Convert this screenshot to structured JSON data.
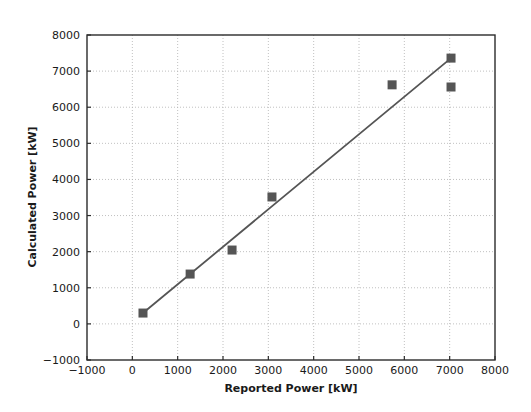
{
  "chart_data": {
    "type": "scatter",
    "title": "",
    "xlabel": "Reported Power [kW]",
    "ylabel": "Calculated Power [kW]",
    "xlim": [
      -1000,
      8000
    ],
    "ylim": [
      -1000,
      8000
    ],
    "xticks": [
      -1000,
      0,
      1000,
      2000,
      3000,
      4000,
      5000,
      6000,
      7000,
      8000
    ],
    "yticks": [
      -1000,
      0,
      1000,
      2000,
      3000,
      4000,
      5000,
      6000,
      7000,
      8000
    ],
    "xtick_labels": [
      "-1000",
      "0",
      "1000",
      "2000",
      "3000",
      "4000",
      "5000",
      "6000",
      "7000",
      "8000"
    ],
    "ytick_labels": [
      "-1000",
      "0",
      "1000",
      "2000",
      "3000",
      "4000",
      "5000",
      "6000",
      "7000",
      "8000"
    ],
    "grid": true,
    "grid_style": "dotted",
    "legend": null,
    "marker_color": "#555555",
    "line_color": "#555555",
    "marker_style": "square",
    "series": [
      {
        "name": "Reported vs Calculated Power",
        "type": "scatter",
        "points": [
          {
            "x": 235,
            "y": 300
          },
          {
            "x": 1275,
            "y": 1380
          },
          {
            "x": 2200,
            "y": 2045
          },
          {
            "x": 3080,
            "y": 3515
          },
          {
            "x": 5730,
            "y": 6620
          },
          {
            "x": 7030,
            "y": 7360
          },
          {
            "x": 7030,
            "y": 6560
          }
        ]
      },
      {
        "name": "Trend line",
        "type": "line",
        "points": [
          {
            "x": 235,
            "y": 300
          },
          {
            "x": 7030,
            "y": 7360
          }
        ]
      }
    ]
  }
}
